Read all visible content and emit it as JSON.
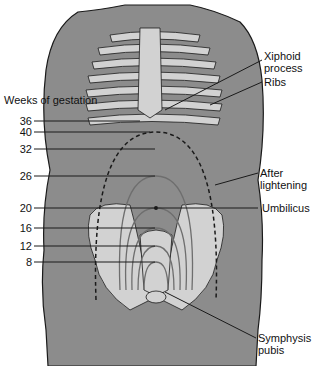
{
  "legend_title": "Weeks of gestation",
  "weeks": [
    {
      "label": "36",
      "y": 121
    },
    {
      "label": "40",
      "y": 132
    },
    {
      "label": "32",
      "y": 149
    },
    {
      "label": "26",
      "y": 176
    },
    {
      "label": "20",
      "y": 208
    },
    {
      "label": "16",
      "y": 228
    },
    {
      "label": "12",
      "y": 246
    },
    {
      "label": "8",
      "y": 262
    }
  ],
  "labels": {
    "xiphoid": "Xiphoid process",
    "xiphoid_l1": "Xiphoid",
    "xiphoid_l2": "process",
    "ribs": "Ribs",
    "after_l1": "After",
    "after_l2": "lightening",
    "umbilicus": "Umbilicus",
    "symphysis_l1": "Symphysis",
    "symphysis_l2": "pubis"
  },
  "colors": {
    "body": "#8c8c8c",
    "bone": "#d2d2d2",
    "outline": "#1a1a1a",
    "uterus_lines": "#6e6e6e"
  }
}
